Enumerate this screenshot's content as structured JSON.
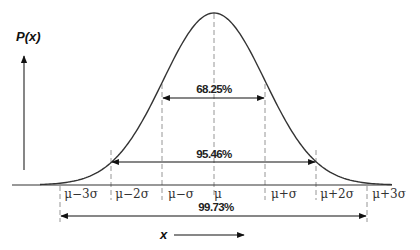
{
  "diagram": {
    "y_axis_label": "P(x)",
    "x_axis_label": "x",
    "tick_labels": [
      "μ−3σ",
      "μ−2σ",
      "μ−σ",
      "μ",
      "μ+σ",
      "μ+2σ",
      "μ+3σ"
    ],
    "intervals": [
      {
        "label": "68.25%",
        "range": "μ−σ to μ+σ"
      },
      {
        "label": "95.46%",
        "range": "μ−2σ to μ+2σ"
      },
      {
        "label": "99.73%",
        "range": "μ−3σ to μ+3σ"
      }
    ],
    "colors": {
      "curve": "#333333",
      "axis": "#222222",
      "dashed_lines": "#888888",
      "arrows": "#111111"
    }
  }
}
